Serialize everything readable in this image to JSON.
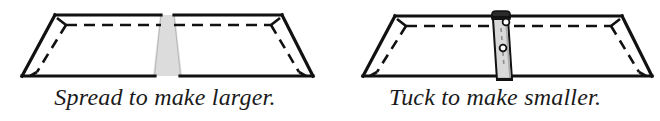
{
  "figure": {
    "background_color": "#ffffff",
    "line_color": "#111111",
    "gap_fill_color": "#dcdcdc",
    "latch_fill_color": "#d8d8d8"
  },
  "panels": [
    {
      "id": "spread",
      "caption": "Spread to make larger.",
      "diagram": {
        "name": "table-top-spread",
        "description": "Trapezoidal table top viewed in perspective, separated at the center by a vertical gap",
        "center_feature": "gap",
        "gap_label": "",
        "outline": {
          "top_left_x": 55,
          "top_right_x": 282,
          "bottom_left_x": 22,
          "bottom_right_x": 313,
          "top_y": 15,
          "bottom_y": 76
        }
      }
    },
    {
      "id": "tuck",
      "caption": "Tuck to make smaller.",
      "diagram": {
        "name": "table-top-tuck",
        "description": "Trapezoidal table top viewed in perspective with a center latch mechanism holding the halves together",
        "center_feature": "latch",
        "latch_parts": [
          "clamp-head",
          "latch-body",
          "pin-hole"
        ],
        "outline": {
          "top_left_x": 65,
          "top_right_x": 292,
          "bottom_left_x": 33,
          "bottom_right_x": 322,
          "top_y": 16,
          "bottom_y": 76
        }
      }
    }
  ]
}
